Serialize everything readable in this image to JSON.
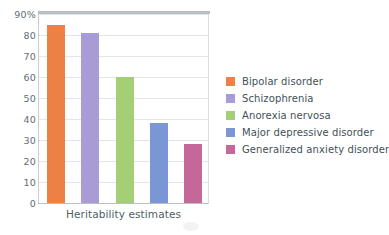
{
  "chart_data": {
    "type": "bar",
    "title": "",
    "xlabel": "Heritability estimates",
    "ylabel": "",
    "categories": [
      "Bipolar disorder",
      "Schizophrenia",
      "Anorexia nervosa",
      "Major depressive disorder",
      "Generalized anxiety disorder"
    ],
    "values": [
      85,
      81,
      60,
      38,
      28
    ],
    "unit": "%",
    "ylim": [
      0,
      90
    ],
    "ytick_labels": [
      "90%",
      "80",
      "70",
      "60",
      "50",
      "40",
      "30",
      "20",
      "10",
      "0"
    ],
    "ytick_values": [
      90,
      80,
      70,
      60,
      50,
      40,
      30,
      20,
      10,
      0
    ],
    "grid": true,
    "legend_position": "right",
    "colors": [
      "#ED8044",
      "#A89BD6",
      "#A5CF76",
      "#7B96D4",
      "#C4689A"
    ],
    "series": [
      {
        "name": "Heritability estimates",
        "values": [
          85,
          81,
          60,
          38,
          28
        ]
      }
    ]
  },
  "legend": {
    "items": [
      {
        "label": "Bipolar disorder",
        "color": "#ED8044"
      },
      {
        "label": "Schizophrenia",
        "color": "#A89BD6"
      },
      {
        "label": "Anorexia nervosa",
        "color": "#A5CF76"
      },
      {
        "label": "Major depressive disorder",
        "color": "#7B96D4"
      },
      {
        "label": "Generalized anxiety disorder",
        "color": "#C4689A"
      }
    ]
  },
  "axes": {
    "x_title": "Heritability estimates",
    "y_labels": [
      "90%",
      "80",
      "70",
      "60",
      "50",
      "40",
      "30",
      "20",
      "10",
      "0"
    ]
  },
  "style": {
    "axis_text_color": "#5d6e75",
    "grid_color": "#e2e6e8",
    "frame_color": "#b9bfc2",
    "background": "#ffffff"
  }
}
